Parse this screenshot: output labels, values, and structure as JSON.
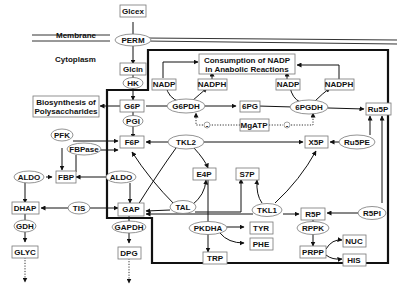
{
  "regions": {
    "membrane": "Membrane",
    "cytoplasm": "Cytoplasm"
  },
  "metabolites": {
    "glcex": "Glcex",
    "glcin": "Glcin",
    "g6p": "G6P",
    "f6p": "F6P",
    "fbp": "FBP",
    "dhap": "DHAP",
    "glyc": "GLYC",
    "gap": "GAP",
    "dpg": "DPG",
    "e4p": "E4P",
    "s7p": "S7P",
    "x5p": "X5P",
    "r5p": "R5P",
    "ru5p": "Ru5P",
    "pg6": "6PG",
    "prpp": "PRPP",
    "nuc": "NUC",
    "his": "HIS",
    "tyr": "TYR",
    "phe": "PHE",
    "trp": "TRP",
    "nadp1": "NADP",
    "nadph1": "NADPH",
    "nadp2": "NADP",
    "nadph2": "NADPH",
    "mgatp": "MgATP"
  },
  "enzymes": {
    "perm": "PERM",
    "hk": "HK",
    "pgi": "PGI",
    "pfk": "PFK",
    "fbpase": "FBPase",
    "aldo_left": "ALDO",
    "aldo_right": "ALDO",
    "tis": "TIS",
    "gdh": "GDH",
    "gapdh": "GAPDH",
    "g6pdh": "G6PDH",
    "pgdh6": "6PGDH",
    "tkl2": "TKL2",
    "tkl1": "TKL1",
    "tal": "TAL",
    "ru5pe": "Ru5PE",
    "r5pi": "R5PI",
    "rppk": "RPPK",
    "pkdha": "PKDHA"
  },
  "sinks": {
    "polysaccharides_line1": "Biosynthesis of",
    "polysaccharides_line2": "Polysaccharides",
    "nadp_consumption_line1": "Consumption of NADP",
    "nadp_consumption_line2": "in Anabolic Reactions"
  },
  "modifiers": {
    "inhibit_left": "-",
    "inhibit_right": "-"
  }
}
